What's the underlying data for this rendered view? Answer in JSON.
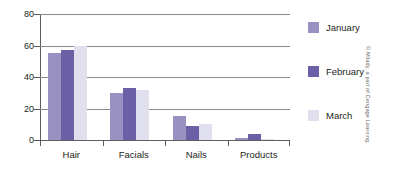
{
  "chart_data": {
    "type": "bar",
    "title": "",
    "xlabel": "",
    "ylabel": "",
    "categories": [
      "Hair",
      "Facials",
      "Nails",
      "Products"
    ],
    "series": [
      {
        "name": "January",
        "color": "#9a91c3",
        "values": [
          55,
          30,
          15,
          1
        ]
      },
      {
        "name": "February",
        "color": "#6b5fa5",
        "values": [
          57,
          33,
          9,
          4
        ]
      },
      {
        "name": "March",
        "color": "#e0dfee",
        "values": [
          60,
          32,
          10,
          0.5
        ]
      }
    ],
    "ylim": [
      0,
      80
    ],
    "yticks": [
      0,
      20,
      40,
      60,
      80
    ],
    "ytick_labels": [
      "0",
      "20",
      "40",
      "60",
      "80"
    ],
    "grid": true,
    "legend_position": "right"
  },
  "credit": "© Milady, a part of Cengage Learning."
}
